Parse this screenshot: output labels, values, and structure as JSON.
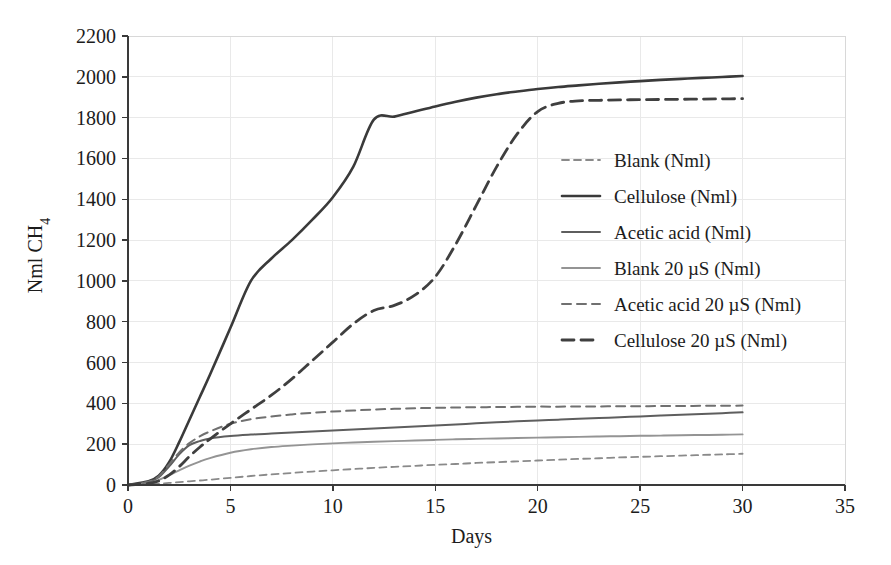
{
  "chart_data": {
    "type": "line",
    "title": "",
    "xlabel": "Days",
    "ylabel": "Nml CH4",
    "ylabel_display": "Nml CH₄",
    "xlim": [
      0,
      35
    ],
    "ylim": [
      0,
      2200
    ],
    "xticks": [
      0,
      5,
      10,
      15,
      20,
      25,
      30,
      35
    ],
    "yticks": [
      0,
      200,
      400,
      600,
      800,
      1000,
      1200,
      1400,
      1600,
      1800,
      2000,
      2200
    ],
    "grid": true,
    "legend_position": "center-right",
    "x": [
      0,
      1,
      1.5,
      2,
      2.5,
      3,
      3.5,
      4,
      5,
      6,
      7,
      8,
      9,
      10,
      11,
      12,
      13,
      14,
      15,
      16,
      17,
      18,
      19,
      20,
      21,
      22,
      23,
      24,
      25,
      26,
      27,
      28,
      29,
      30
    ],
    "series": [
      {
        "name": "Blank (Nml)",
        "label": "Blank (Nml)",
        "style": "dashed",
        "color": "#8a8a8a",
        "width": 1.8,
        "dash": "7,5",
        "values": [
          0,
          3,
          6,
          10,
          14,
          18,
          22,
          26,
          35,
          44,
          52,
          59,
          66,
          72,
          78,
          84,
          89,
          94,
          99,
          103,
          108,
          112,
          116,
          120,
          124,
          128,
          131,
          135,
          138,
          141,
          144,
          147,
          150,
          153
        ]
      },
      {
        "name": "Cellulose (Nml)",
        "label": "Cellulose (Nml)",
        "style": "solid",
        "color": "#3a3a3a",
        "width": 2.6,
        "dash": "",
        "values": [
          0,
          18,
          45,
          110,
          210,
          320,
          430,
          540,
          770,
          1000,
          1110,
          1200,
          1300,
          1410,
          1560,
          1790,
          1805,
          1830,
          1855,
          1878,
          1898,
          1915,
          1928,
          1940,
          1950,
          1958,
          1966,
          1973,
          1979,
          1985,
          1990,
          1995,
          1999,
          2004
        ]
      },
      {
        "name": "Acetic acid (Nml)",
        "label": "Acetic acid (Nml)",
        "style": "solid",
        "color": "#5e5e5e",
        "width": 2.0,
        "dash": "",
        "values": [
          0,
          14,
          38,
          90,
          150,
          195,
          215,
          228,
          240,
          247,
          252,
          257,
          262,
          267,
          272,
          277,
          282,
          287,
          292,
          297,
          302,
          307,
          312,
          316,
          320,
          324,
          328,
          332,
          336,
          340,
          344,
          348,
          352,
          356
        ]
      },
      {
        "name": "Blank 20 µS (Nml)",
        "label": "Blank 20 µS (Nml)",
        "style": "solid",
        "color": "#949494",
        "width": 1.9,
        "dash": "",
        "values": [
          0,
          10,
          25,
          48,
          72,
          95,
          115,
          132,
          158,
          175,
          186,
          193,
          199,
          204,
          208,
          212,
          215,
          218,
          221,
          224,
          226,
          228,
          230,
          232,
          234,
          236,
          238,
          239,
          241,
          242,
          244,
          245,
          246,
          248
        ]
      },
      {
        "name": "Acetic acid 20 µS (Nml)",
        "label": "Acetic acid 20 µS (Nml)",
        "style": "dashed",
        "color": "#707070",
        "width": 2.0,
        "dash": "9,6",
        "values": [
          0,
          16,
          42,
          100,
          160,
          205,
          238,
          262,
          300,
          322,
          336,
          346,
          354,
          360,
          365,
          370,
          373,
          376,
          378,
          380,
          381,
          382,
          383,
          384,
          384,
          385,
          385,
          386,
          386,
          387,
          387,
          388,
          388,
          389
        ]
      },
      {
        "name": "Cellulose 20 µS (Nml)",
        "label": "Cellulose 20 µS (Nml)",
        "style": "dashed",
        "color": "#3f3f3f",
        "width": 2.8,
        "dash": "12,7",
        "values": [
          0,
          8,
          20,
          48,
          90,
          140,
          185,
          225,
          300,
          370,
          440,
          520,
          610,
          700,
          790,
          855,
          880,
          930,
          1020,
          1180,
          1370,
          1560,
          1720,
          1830,
          1870,
          1882,
          1885,
          1887,
          1888,
          1889,
          1890,
          1891,
          1892,
          1893
        ]
      }
    ]
  }
}
